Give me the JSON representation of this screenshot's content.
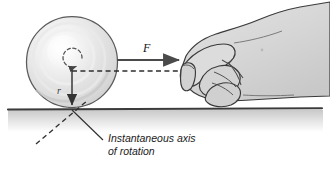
{
  "figure": {
    "background_color": "#ffffff"
  },
  "labels": {
    "force": "F",
    "radius": "r",
    "caption_line1": "Instantaneous axis",
    "caption_line2": "of rotation"
  },
  "colors": {
    "ball_outline": "#555555",
    "ball_fill_light": "#fbfbfb",
    "ball_fill_mid": "#e4e4e4",
    "ball_fill_dark": "#d2d2d2",
    "ground_line": "#3b3b3b",
    "ground_shade": "#cfcfcf",
    "hand_outline": "#3a3a3a",
    "hand_fill": "#d8d8d8",
    "arrow": "#4a4a4a",
    "dashed": "#2e2e2e",
    "text": "#1a1a1a"
  },
  "geometry": {
    "ball_center_x": 72,
    "ball_center_y": 62,
    "ball_radius": 45,
    "contact_point_x": 72,
    "contact_point_y": 109,
    "ground_y": 109,
    "force_arrow_start_x": 118,
    "force_arrow_end_x": 180,
    "force_arrow_y": 60
  },
  "elements": {
    "ball_name": "ball",
    "ground_name": "ground-surface",
    "hand_name": "hand-pushing",
    "force_arrow_name": "force-arrow",
    "radius_arrow_name": "radius-arrow",
    "rotation_indicator_name": "rotation-arrow",
    "axis_dashed_name": "instantaneous-axis-dashed-line",
    "leader_name": "caption-leader-line"
  }
}
